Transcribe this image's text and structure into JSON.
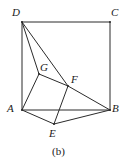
{
  "figure": {
    "caption": "(b)",
    "caption_position": {
      "x": 52,
      "y": 146
    },
    "width": 124,
    "height": 164,
    "background_color": "#ffffff",
    "stroke_color": "#2b2b2b",
    "stroke_width": 1,
    "label_color": "#1a1a1a"
  },
  "points": [
    {
      "id": "D",
      "label": "D",
      "x": 22,
      "y": 22,
      "label_x": 12,
      "label_y": 7
    },
    {
      "id": "C",
      "label": "C",
      "x": 110,
      "y": 22,
      "label_x": 111,
      "label_y": 7
    },
    {
      "id": "A",
      "label": "A",
      "x": 22,
      "y": 110,
      "label_x": 7,
      "label_y": 103
    },
    {
      "id": "B",
      "label": "B",
      "x": 110,
      "y": 110,
      "label_x": 112,
      "label_y": 103
    },
    {
      "id": "G",
      "label": "G",
      "x": 39,
      "y": 74,
      "label_x": 40,
      "label_y": 62
    },
    {
      "id": "F",
      "label": "F",
      "x": 68,
      "y": 86,
      "label_x": 71,
      "label_y": 74
    },
    {
      "id": "E",
      "label": "E",
      "x": 54,
      "y": 124,
      "label_x": 49,
      "label_y": 128
    }
  ],
  "edges": [
    {
      "id": "DC",
      "from": "D",
      "to": "C",
      "name": "edge-d-c"
    },
    {
      "id": "CB",
      "from": "C",
      "to": "B",
      "name": "edge-c-b"
    },
    {
      "id": "DA",
      "from": "D",
      "to": "A",
      "name": "edge-d-a"
    },
    {
      "id": "AB",
      "from": "A",
      "to": "B",
      "name": "edge-a-b"
    },
    {
      "id": "DG",
      "from": "D",
      "to": "G",
      "name": "edge-d-g"
    },
    {
      "id": "DF",
      "from": "D",
      "to": "F",
      "name": "edge-d-f"
    },
    {
      "id": "AG",
      "from": "A",
      "to": "G",
      "name": "edge-a-g"
    },
    {
      "id": "GF",
      "from": "G",
      "to": "F",
      "name": "edge-g-f"
    },
    {
      "id": "FB",
      "from": "F",
      "to": "B",
      "name": "edge-f-b"
    },
    {
      "id": "AE",
      "from": "A",
      "to": "E",
      "name": "edge-a-e"
    },
    {
      "id": "EB",
      "from": "E",
      "to": "B",
      "name": "edge-e-b"
    },
    {
      "id": "EF",
      "from": "E",
      "to": "F",
      "name": "edge-e-f"
    }
  ]
}
